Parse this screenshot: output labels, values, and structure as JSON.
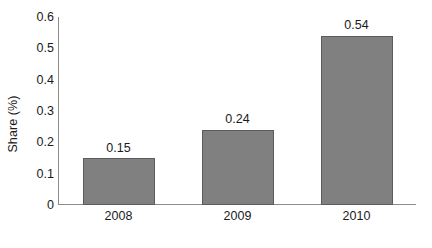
{
  "chart_data": {
    "type": "bar",
    "title": "",
    "subtitle": "",
    "xlabel": "",
    "ylabel": "Share (%)",
    "categories": [
      "2008",
      "2009",
      "2010"
    ],
    "values": [
      0.15,
      0.24,
      0.54
    ],
    "value_labels": [
      "0.15",
      "0.24",
      "0.54"
    ],
    "ylim": [
      0,
      0.6
    ],
    "ytick_labels": [
      "0",
      "0.1",
      "0.2",
      "0.3",
      "0.4",
      "0.5",
      "0.6"
    ],
    "ytick_values": [
      0,
      0.1,
      0.2,
      0.3,
      0.4,
      0.5,
      0.6
    ],
    "grid": false,
    "legend": false,
    "legend_position": "none",
    "series": [
      {
        "name": "Share (%)",
        "values": [
          0.15,
          0.24,
          0.54
        ]
      }
    ],
    "colors": {
      "bar_fill": "#808080",
      "bar_edge": "#5c5c5c",
      "axis": "#8c8c8c",
      "text": "#1a1a1a",
      "background": "#ffffff"
    }
  }
}
